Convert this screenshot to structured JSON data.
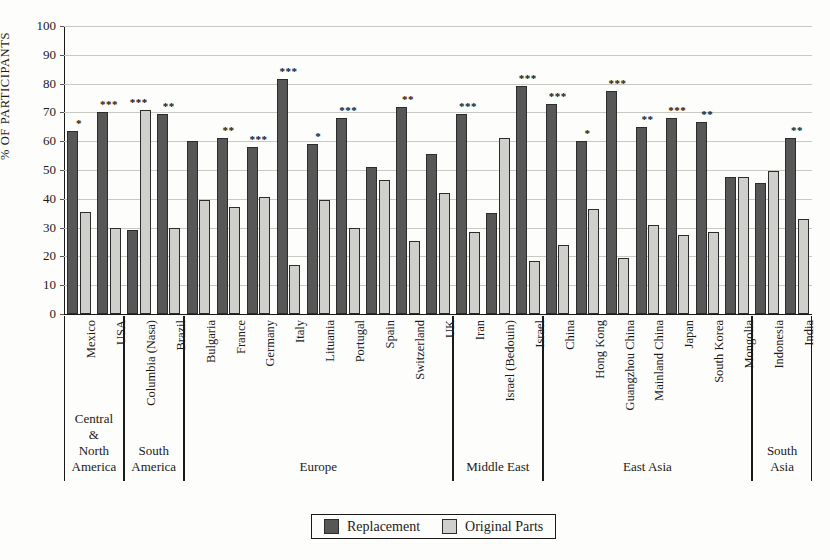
{
  "chart_data": {
    "type": "bar",
    "title": "",
    "xlabel": "",
    "ylabel": "% OF PARTICIPANTS",
    "ylim": [
      0,
      100
    ],
    "ytick_step": 10,
    "yticks": [
      "100",
      "90",
      "80",
      "70",
      "60",
      "50",
      "40",
      "30",
      "20",
      "10",
      "0"
    ],
    "grid": true,
    "legend_position": "bottom-center",
    "legend": [
      "Replacement",
      "Original Parts"
    ],
    "series": [
      {
        "name": "Replacement",
        "color": "#575757",
        "values": [
          63.5,
          70,
          29,
          69.5,
          60,
          61,
          58,
          81.5,
          59,
          68,
          51,
          72,
          55.5,
          69.5,
          35,
          79,
          73,
          60,
          77.5,
          65,
          68,
          66.5,
          47.5,
          45.5,
          61
        ]
      },
      {
        "name": "Original Parts",
        "color": "#cfcfcb",
        "values": [
          35.5,
          30,
          71,
          30,
          39.5,
          37,
          40.5,
          17,
          39.5,
          30,
          46.5,
          25.5,
          42,
          28.5,
          61,
          18.5,
          24,
          36.5,
          19.5,
          31,
          27.5,
          28.5,
          47.5,
          49.5,
          33
        ]
      }
    ],
    "categories": [
      "Mexico",
      "USA",
      "Columbia (Nasa)",
      "Brazil",
      "Bulgaria",
      "France",
      "Germany",
      "Italy",
      "Lituania",
      "Portugal",
      "Spain",
      "Switzerland",
      "UK",
      "Iran",
      "Israel (Bedouin)",
      "Israel",
      "China",
      "Hong Kong",
      "Guangzhou China",
      "Mainland China",
      "Japan",
      "South Korea",
      "Mongolia",
      "Indonesia",
      "India"
    ],
    "significance": [
      "*",
      "***",
      "***",
      "**",
      "",
      "**",
      "***",
      "***",
      "*",
      "***",
      "",
      "**",
      "",
      "***",
      "",
      "***",
      "***",
      "*",
      "***",
      "**",
      "***",
      "**",
      "",
      "",
      "**"
    ],
    "regions": [
      {
        "name": "Central\n&\nNorth\nAmerica",
        "start": 0,
        "end": 1
      },
      {
        "name": "South\nAmerica",
        "start": 2,
        "end": 3
      },
      {
        "name": "Europe",
        "start": 4,
        "end": 12
      },
      {
        "name": "Middle East",
        "start": 13,
        "end": 15
      },
      {
        "name": "East Asia",
        "start": 16,
        "end": 22
      },
      {
        "name": "South\nAsia",
        "start": 23,
        "end": 24
      }
    ]
  },
  "legend": {
    "replacement_label": "Replacement",
    "original_label": "Original Parts"
  },
  "axis": {
    "y_title": "% OF PARTICIPANTS"
  }
}
